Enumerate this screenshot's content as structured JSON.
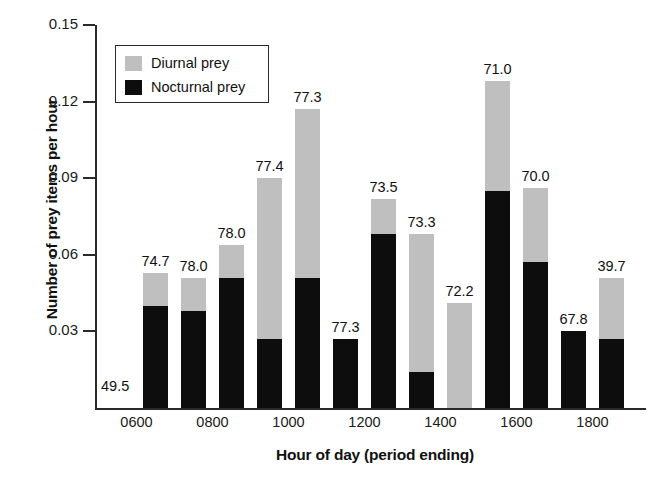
{
  "chart_data": {
    "type": "bar",
    "subtype": "stacked-bar",
    "title": "",
    "xlabel": "Hour of day (period ending)",
    "ylabel": "Number of prey items per hour",
    "ylim": [
      0,
      0.15
    ],
    "yticks": [
      "0.03",
      "0.06",
      "0.09",
      "0.12",
      "0.15"
    ],
    "ytick_values": [
      0.03,
      0.06,
      0.09,
      0.12,
      0.15
    ],
    "grid": false,
    "legend_position": "upper-left-inside",
    "legend": [
      {
        "key": "diurnal",
        "label": "Diurnal prey",
        "color": "#bfbfbf"
      },
      {
        "key": "nocturnal",
        "label": "Nocturnal prey",
        "color": "#0d0d0d"
      }
    ],
    "categories": [
      "0700",
      "0800",
      "0900",
      "1000",
      "1100",
      "1200",
      "1300",
      "1400",
      "1500",
      "1600",
      "1700",
      "1800",
      "1900"
    ],
    "xtick_labels": [
      "0600",
      "0800",
      "1000",
      "1200",
      "1400",
      "1600",
      "1800"
    ],
    "series": [
      {
        "name": "Nocturnal prey",
        "color": "#0d0d0d",
        "values": [
          0.04,
          0.038,
          0.051,
          0.027,
          0.051,
          0.027,
          0.068,
          0.014,
          0.0,
          0.085,
          0.057,
          0.03,
          0.027
        ]
      },
      {
        "name": "Diurnal prey",
        "color": "#bfbfbf",
        "values": [
          0.013,
          0.013,
          0.013,
          0.063,
          0.066,
          0.0,
          0.014,
          0.054,
          0.041,
          0.043,
          0.029,
          0.0,
          0.024
        ]
      }
    ],
    "totals": [
      0.053,
      0.051,
      0.064,
      0.09,
      0.117,
      0.027,
      0.082,
      0.068,
      0.041,
      0.128,
      0.086,
      0.03,
      0.051
    ],
    "bar_labels": [
      "74.7",
      "78.0",
      "78.0",
      "77.4",
      "77.3",
      "77.3",
      "73.5",
      "73.3",
      "72.2",
      "71.0",
      "70.0",
      "67.8",
      "39.7"
    ],
    "baseline_label": "49.5",
    "annotations": [
      {
        "text": "49.5",
        "note": "label at left of baseline, for the 0600 period"
      }
    ]
  },
  "axes": {
    "y_title": "Number of prey items per hour",
    "x_title": "Hour of day (period ending)"
  },
  "legend": {
    "diurnal_label": "Diurnal prey",
    "nocturnal_label": "Nocturnal prey"
  }
}
